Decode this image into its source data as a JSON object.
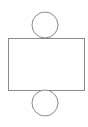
{
  "diagram": {
    "title": "",
    "stroke_color": "#8a8a8a",
    "fill_color": "#ffffff",
    "shapes": {
      "top_circle": {
        "cx": 45,
        "cy": 25,
        "r": 13
      },
      "rectangle": {
        "x": 8,
        "y": 38,
        "width": 76,
        "height": 52
      },
      "bottom_circle": {
        "cx": 45,
        "cy": 103,
        "r": 13
      }
    }
  }
}
